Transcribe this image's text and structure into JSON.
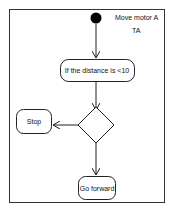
{
  "diagram": {
    "type": "activity",
    "note": {
      "line1": "Move motor A",
      "line2": "TA"
    },
    "nodes": {
      "decision_action": "If the distance is <10",
      "stop": "Stop",
      "forward": "Go forward"
    },
    "colors": {
      "stroke": "#222222",
      "fill": "#ffffff",
      "initial": "#000000"
    }
  }
}
